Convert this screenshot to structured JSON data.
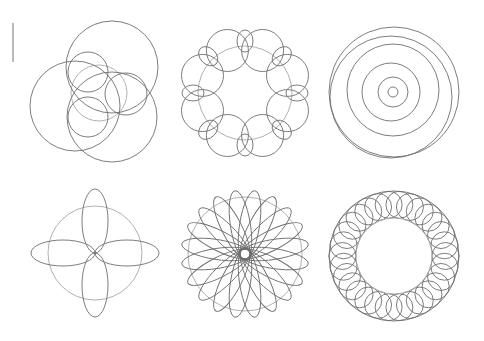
{
  "colors": {
    "background": "#ffffff",
    "line": "#6e6e6e",
    "guide": "#a8a8a8",
    "marker": "#8a8a8a"
  },
  "marker": {
    "x": 13,
    "y1": 23,
    "y2": 62
  },
  "patterns": [
    {
      "name": "three-lobe-epicycle",
      "type": "circles",
      "guide": {
        "cx": 99,
        "cy": 93,
        "r": 28
      },
      "circles": [
        {
          "cx": 112,
          "cy": 67,
          "r": 46
        },
        {
          "cx": 75,
          "cy": 106,
          "r": 45
        },
        {
          "cx": 112,
          "cy": 117,
          "r": 45
        },
        {
          "cx": 88,
          "cy": 72,
          "r": 20
        },
        {
          "cx": 126,
          "cy": 94,
          "r": 21
        },
        {
          "cx": 88,
          "cy": 117,
          "r": 20
        }
      ]
    },
    {
      "name": "eight-loop-epitrochoid",
      "type": "loops",
      "cx": 245,
      "cy": 93,
      "guide_r": 47,
      "count": 8,
      "loop_rx": 21,
      "loop_ry": 21,
      "loop_center_r": 46,
      "small_rx": 8,
      "small_ry": 11,
      "small_center_r": 52
    },
    {
      "name": "nested-circles",
      "type": "circles",
      "circles": [
        {
          "cx": 394,
          "cy": 92,
          "r": 65
        },
        {
          "cx": 391,
          "cy": 97,
          "r": 61
        },
        {
          "cx": 393,
          "cy": 90,
          "r": 46
        },
        {
          "cx": 391,
          "cy": 92,
          "r": 29
        },
        {
          "cx": 393,
          "cy": 92,
          "r": 15
        },
        {
          "cx": 393,
          "cy": 92,
          "r": 5
        }
      ]
    },
    {
      "name": "four-petal-rose",
      "type": "petals",
      "cx": 95,
      "cy": 253,
      "guide_r": 47,
      "count": 4,
      "petal_len": 64,
      "petal_width": 13,
      "rotation": 0
    },
    {
      "name": "twenty-petal-rose",
      "type": "petals",
      "cx": 245,
      "cy": 254,
      "guide_r": 57,
      "count": 20,
      "petal_len": 64,
      "petal_width": 10,
      "inner_r": 6,
      "rotation": 9
    },
    {
      "name": "circle-ring",
      "type": "ring",
      "cx": 394,
      "cy": 256,
      "count": 30,
      "ring_r": 51.5,
      "circle_r": 13.5,
      "outer_r": 65,
      "inner_r": 38
    }
  ]
}
